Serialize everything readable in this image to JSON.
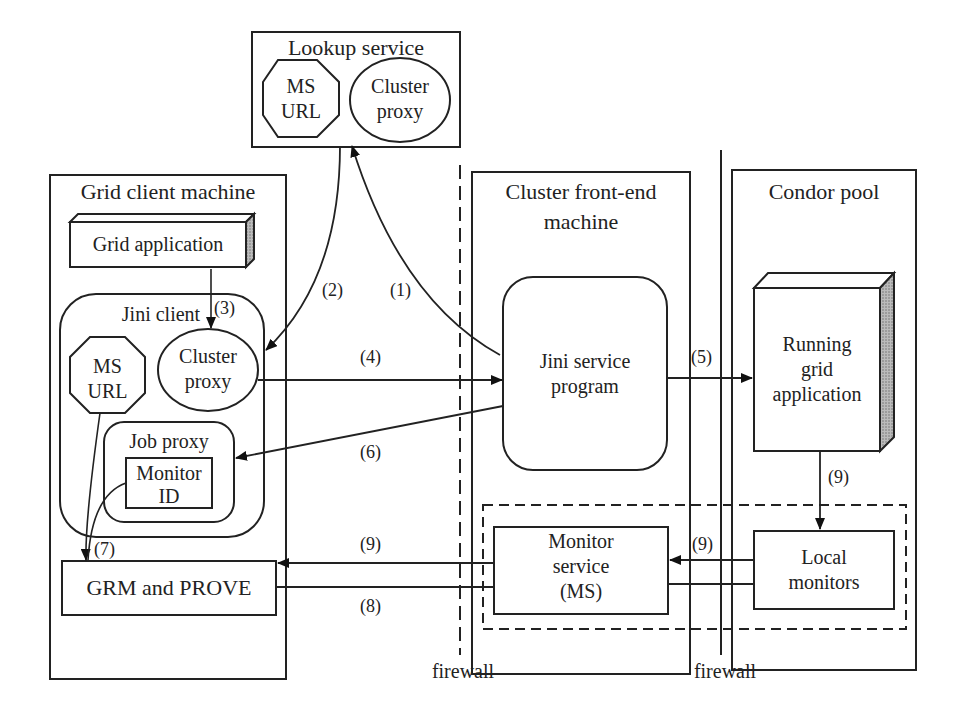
{
  "lookup_service": {
    "title": "Lookup service",
    "ms_url": [
      "MS",
      "URL"
    ],
    "cluster_proxy": [
      "Cluster",
      "proxy"
    ]
  },
  "grid_client": {
    "title": "Grid client machine",
    "grid_application": "Grid application",
    "jini_client": "Jini client",
    "ms_url": [
      "MS",
      "URL"
    ],
    "cluster_proxy": [
      "Cluster",
      "proxy"
    ],
    "job_proxy": "Job proxy",
    "monitor_id": [
      "Monitor",
      "ID"
    ],
    "grm_prove": "GRM and PROVE"
  },
  "cluster_frontend": {
    "title": [
      "Cluster front-end",
      "machine"
    ],
    "jini_service": [
      "Jini service",
      "program"
    ],
    "monitor_service": [
      "Monitor",
      "service",
      "(MS)"
    ]
  },
  "condor_pool": {
    "title": "Condor pool",
    "running_app": [
      "Running",
      "grid",
      "application"
    ],
    "local_monitors": [
      "Local",
      "monitors"
    ]
  },
  "firewalls": [
    "firewall",
    "firewall"
  ],
  "steps": {
    "s1": "(1)",
    "s2": "(2)",
    "s3": "(3)",
    "s4": "(4)",
    "s5": "(5)",
    "s6": "(6)",
    "s7": "(7)",
    "s8": "(8)",
    "s9a": "(9)",
    "s9b": "(9)",
    "s9c": "(9)"
  }
}
